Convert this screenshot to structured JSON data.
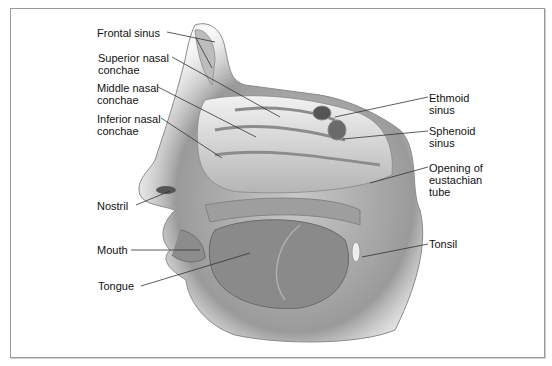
{
  "diagram": {
    "type": "anatomical-illustration",
    "labels": {
      "frontal_sinus": "Frontal sinus",
      "superior_nasal_conchae": "Superior nasal\nconchae",
      "middle_nasal_conchae": "Middle nasal\nconchae",
      "inferior_nasal_conchae": "Inferior nasal\nconchae",
      "nostril": "Nostril",
      "mouth": "Mouth",
      "tongue": "Tongue",
      "ethmoid_sinus": "Ethmoid\nsinus",
      "sphenoid_sinus": "Sphenoid\nsinus",
      "opening_of_eustachian_tube": "Opening of\neustachian\ntube",
      "tonsil": "Tonsil"
    },
    "colors": {
      "line": "#333333",
      "tissue_dark": "#6e6e6e",
      "tissue_mid": "#a8a8a8",
      "tissue_light": "#dcdcdc",
      "frame": "#9a9a9a"
    }
  }
}
